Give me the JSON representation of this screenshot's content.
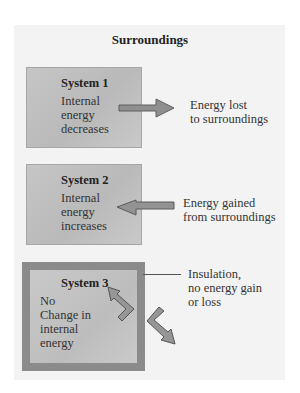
{
  "diagram": {
    "title": "Surroundings",
    "colors": {
      "panel_background": "#f3f3f3",
      "system_fill": "#c0c0c0",
      "insulation_border": "#8b8b8b",
      "arrow_fill": "#909090"
    },
    "systems": [
      {
        "title": "System 1",
        "description_lines": [
          "Internal",
          "energy",
          "decreases"
        ],
        "arrow_direction": "out",
        "arrow_label_lines": [
          "Energy lost",
          "to surroundings"
        ]
      },
      {
        "title": "System 2",
        "description_lines": [
          "Internal",
          "energy",
          "increases"
        ],
        "arrow_direction": "in",
        "arrow_label_lines": [
          "Energy gained",
          "from surroundings"
        ]
      },
      {
        "title": "System 3",
        "description_lines": [
          "No",
          "Change in",
          "internal",
          "energy"
        ],
        "arrow_direction": "blocked",
        "insulated": true,
        "callout_lines": [
          "Insulation,",
          "no energy gain",
          "or loss"
        ]
      }
    ]
  }
}
